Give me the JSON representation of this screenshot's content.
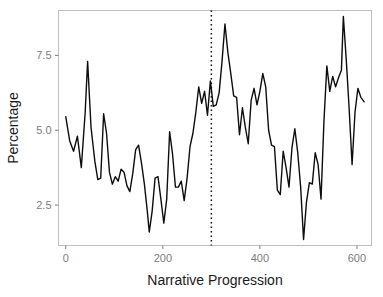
{
  "chart_data": {
    "type": "line",
    "title": "",
    "subtitle": "",
    "xlabel": "Narrative Progression",
    "ylabel": "Percentage",
    "xlim": [
      -15,
      630
    ],
    "ylim": [
      1.15,
      9.0
    ],
    "xticks": [
      0,
      200,
      400,
      600
    ],
    "xtick_labels": [
      "0",
      "200",
      "400",
      "600"
    ],
    "yticks": [
      2.5,
      5.0,
      7.5
    ],
    "ytick_labels": [
      "2.5",
      "5.0",
      "7.5"
    ],
    "grid": false,
    "legend": "none",
    "line_color": "#0d0d0d",
    "panel_border_color": "#bfbfbf",
    "tick_label_color": "#7d7d7d",
    "annotations": [
      {
        "name": "midpoint-reference-line",
        "type": "vertical-dotted-line",
        "x": 300,
        "style": "dotted",
        "color": "#111111"
      }
    ],
    "series": [
      {
        "name": "Percentage",
        "x": [
          0,
          8,
          16,
          24,
          32,
          40,
          45,
          52,
          60,
          66,
          72,
          78,
          84,
          90,
          96,
          102,
          108,
          114,
          120,
          126,
          132,
          138,
          144,
          150,
          156,
          162,
          168,
          172,
          178,
          184,
          190,
          196,
          202,
          208,
          214,
          220,
          226,
          232,
          238,
          244,
          250,
          256,
          262,
          268,
          274,
          280,
          286,
          292,
          298,
          304,
          310,
          316,
          322,
          328,
          334,
          340,
          346,
          352,
          358,
          364,
          370,
          376,
          382,
          388,
          394,
          400,
          406,
          412,
          418,
          424,
          430,
          436,
          442,
          448,
          454,
          460,
          466,
          472,
          478,
          484,
          490,
          496,
          502,
          508,
          514,
          520,
          526,
          532,
          538,
          544,
          550,
          556,
          562,
          568,
          572,
          578,
          584,
          590,
          596,
          602,
          608,
          615
        ],
        "y": [
          5.45,
          4.65,
          4.3,
          4.8,
          3.75,
          5.6,
          7.3,
          5.1,
          3.95,
          3.35,
          3.4,
          5.55,
          4.9,
          3.6,
          3.2,
          3.45,
          3.3,
          3.7,
          3.6,
          3.15,
          2.95,
          3.55,
          4.35,
          4.5,
          3.9,
          3.2,
          2.3,
          1.6,
          2.3,
          3.4,
          3.45,
          2.7,
          1.9,
          2.7,
          4.95,
          4.2,
          3.1,
          3.1,
          3.3,
          2.65,
          3.4,
          4.45,
          4.9,
          5.6,
          6.45,
          5.9,
          6.3,
          5.5,
          6.65,
          5.8,
          5.85,
          6.25,
          7.3,
          8.55,
          7.6,
          6.9,
          6.15,
          6.1,
          4.85,
          5.75,
          5.1,
          4.55,
          6.0,
          6.4,
          5.85,
          6.3,
          6.9,
          6.45,
          5.0,
          4.5,
          4.45,
          3.0,
          2.85,
          4.3,
          3.75,
          3.1,
          4.4,
          5.05,
          4.25,
          3.1,
          1.35,
          2.6,
          3.25,
          3.2,
          4.25,
          3.85,
          2.7,
          5.3,
          7.15,
          6.3,
          6.8,
          6.45,
          6.75,
          7.0,
          8.8,
          7.35,
          5.7,
          3.85,
          5.6,
          6.4,
          6.1,
          5.95
        ]
      }
    ]
  },
  "labels": {
    "y_axis_title": "Percentage",
    "x_axis_title": "Narrative Progression"
  }
}
